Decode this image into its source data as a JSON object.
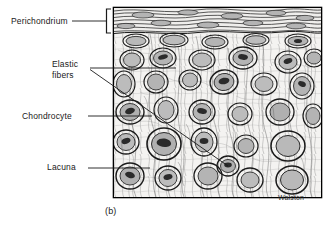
{
  "figure": {
    "panel_caption": "(b)",
    "credit": "Walston",
    "tissue": "elastic cartilage",
    "frame": {
      "x": 113,
      "y": 7,
      "width": 209,
      "height": 191,
      "border_color": "#000000"
    },
    "background_color": "#ffffff",
    "ink_color": "#1a1a1a",
    "cell_fill_color": "#b9b9b9",
    "nucleus_color": "#2b2b2b",
    "matrix_color": "#f2f2f0"
  },
  "labels": [
    {
      "id": "perichondrium",
      "text": "Perichondrium",
      "text_x": 11,
      "text_y": 16,
      "leader": {
        "type": "bracket",
        "x1": 72,
        "y1": 21,
        "x2": 106,
        "y2": 21,
        "bracket_x": 107,
        "bracket_top": 9,
        "bracket_bottom": 33
      }
    },
    {
      "id": "elastic-fibers",
      "text_lines": [
        "Elastic",
        "fibers"
      ],
      "text_x": 52,
      "text_y": 59,
      "leaders": [
        {
          "x1": 90,
          "y1": 68,
          "x2": 176,
          "y2": 68
        },
        {
          "x1": 90,
          "y1": 69,
          "x2": 228,
          "y2": 166
        }
      ]
    },
    {
      "id": "chondrocyte",
      "text": "Chondrocyte",
      "text_x": 22,
      "text_y": 111,
      "leader": {
        "x1": 88,
        "y1": 116,
        "x2": 152,
        "y2": 116
      }
    },
    {
      "id": "lacuna",
      "text": "Lacuna",
      "text_x": 47,
      "text_y": 162,
      "leader": {
        "x1": 88,
        "y1": 168,
        "x2": 150,
        "y2": 168
      }
    }
  ]
}
